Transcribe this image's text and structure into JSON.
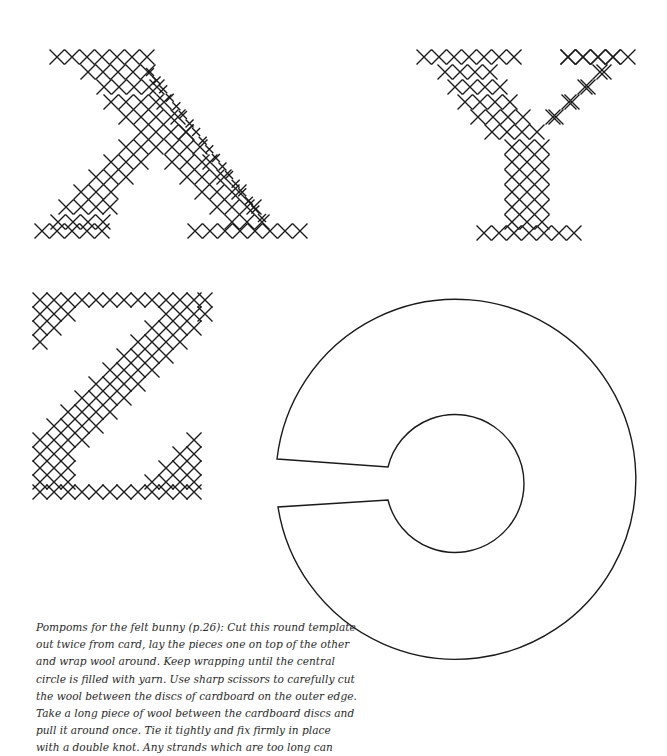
{
  "page": {
    "background": "#ffffff",
    "ink_color": "#1a1a1a"
  },
  "letters": [
    {
      "name": "X",
      "strokes": [
        {
          "from": [
            57,
            57
          ],
          "to": [
            57,
            57
          ],
          "count": 1
        },
        {
          "row": 57,
          "x_start": 57,
          "x_end": 150,
          "step": 15.5,
          "size": 7.5
        },
        {
          "row": 57,
          "x_start": 568,
          "x_end": 625,
          "step": 15.5,
          "size": 7.5,
          "comment": "unused"
        }
      ]
    }
  ],
  "caption": {
    "lines": [
      "Pompoms for the felt bunny (p.26): Cut this round template",
      "out twice from card, lay the pieces one on top of the other",
      "and wrap wool around. Keep wrapping until the central",
      "circle is filled with yarn. Use sharp scissors to carefully cut",
      "the wool between the discs of cardboard on the outer edge.",
      "Take a long piece of wool between the cardboard discs and",
      "pull it around once. Tie it tightly and fix firmly in place",
      "with a double knot. Any strands which are too long can"
    ]
  },
  "template": {
    "label": "pompom-template",
    "outer": {
      "cx": 455,
      "cy": 480,
      "r": 180
    },
    "inner": {
      "cx": 455,
      "cy": 484,
      "r": 69
    },
    "slot": {
      "outer_top": [
        277,
        459
      ],
      "inner_top": [
        388,
        467
      ],
      "inner_bottom": [
        388,
        500
      ],
      "outer_bottom": [
        278,
        507
      ]
    }
  },
  "cross_stitch": {
    "X": {
      "rows": [
        {
          "y": 57,
          "xs": [
            57,
            72,
            87,
            102,
            117,
            132,
            147
          ]
        },
        {
          "y": 57,
          "xs": [
            568,
            583,
            598,
            613
          ]
        },
        {
          "y": 72,
          "xs": [
            88,
            103,
            118,
            133,
            148
          ]
        },
        {
          "y": 72,
          "xs": [
            604
          ]
        },
        {
          "y": 87,
          "xs": [
            104,
            119,
            134,
            149,
            157
          ]
        },
        {
          "y": 87,
          "xs": [
            588
          ]
        },
        {
          "y": 102,
          "xs": [
            111,
            126,
            141,
            156,
            164
          ]
        },
        {
          "y": 102,
          "xs": [
            572
          ]
        },
        {
          "y": 117,
          "xs": [
            126,
            141,
            156,
            171,
            178
          ]
        },
        {
          "y": 117,
          "xs": [
            556
          ]
        },
        {
          "y": 132,
          "xs": [
            141,
            156,
            171,
            186
          ]
        },
        {
          "y": 132,
          "xs": [
            186
          ]
        },
        {
          "y": 147,
          "xs": [
            126,
            141,
            156,
            172,
            187,
            200
          ]
        },
        {
          "y": 162,
          "xs": [
            111,
            126,
            141,
            172,
            187,
            202,
            210
          ]
        },
        {
          "y": 177,
          "xs": [
            96,
            111,
            126,
            187,
            202,
            217,
            224
          ]
        },
        {
          "y": 192,
          "xs": [
            81,
            96,
            111,
            202,
            217,
            232,
            239
          ]
        },
        {
          "y": 207,
          "xs": [
            66,
            81,
            96,
            110,
            217,
            232,
            247,
            254
          ]
        },
        {
          "y": 222,
          "xs": [
            58,
            73,
            88,
            103,
            232,
            247,
            262
          ]
        },
        {
          "y": 231,
          "xs": [
            42,
            57,
            72,
            87,
            102,
            195,
            210,
            225,
            240,
            255,
            270,
            285,
            300
          ]
        }
      ],
      "small_diagonal": {
        "from": [
          150,
          72
        ],
        "to": [
          262,
          218
        ],
        "step": 7.5,
        "size": 4
      }
    },
    "Y": {
      "rows": [
        {
          "y": 57,
          "xs": [
            424,
            439,
            454,
            469,
            484,
            499,
            514
          ]
        },
        {
          "y": 57,
          "xs": [
            568,
            583,
            598,
            613,
            628
          ]
        },
        {
          "y": 72,
          "xs": [
            445,
            460,
            475,
            490,
            600
          ]
        },
        {
          "y": 87,
          "xs": [
            455,
            470,
            485,
            500,
            585
          ]
        },
        {
          "y": 102,
          "xs": [
            465,
            480,
            495,
            510,
            569
          ]
        },
        {
          "y": 117,
          "xs": [
            478,
            493,
            508,
            523,
            553
          ]
        },
        {
          "y": 132,
          "xs": [
            492,
            507,
            522,
            537
          ]
        },
        {
          "y": 147,
          "xs": [
            512,
            527,
            542
          ]
        },
        {
          "y": 162,
          "xs": [
            512,
            527,
            542
          ]
        },
        {
          "y": 177,
          "xs": [
            512,
            527,
            542
          ]
        },
        {
          "y": 192,
          "xs": [
            512,
            527,
            542
          ]
        },
        {
          "y": 207,
          "xs": [
            512,
            527,
            542
          ]
        },
        {
          "y": 222,
          "xs": [
            512,
            527,
            542
          ]
        },
        {
          "y": 233,
          "xs": [
            484,
            499,
            514,
            529,
            544,
            559,
            574
          ]
        }
      ]
    },
    "Z": {
      "rows": [
        {
          "y": 300,
          "xs": [
            40,
            54,
            68,
            82,
            96,
            110,
            124,
            138,
            152,
            166,
            180,
            194,
            205
          ]
        },
        {
          "y": 314,
          "xs": [
            40,
            54,
            68,
            166,
            180,
            194,
            205
          ]
        },
        {
          "y": 328,
          "xs": [
            40,
            54,
            152,
            166,
            180,
            194
          ]
        },
        {
          "y": 342,
          "xs": [
            40,
            138,
            152,
            166,
            180
          ]
        },
        {
          "y": 356,
          "xs": [
            124,
            138,
            152,
            166
          ]
        },
        {
          "y": 370,
          "xs": [
            110,
            124,
            138,
            152
          ]
        },
        {
          "y": 384,
          "xs": [
            96,
            110,
            124,
            138
          ]
        },
        {
          "y": 398,
          "xs": [
            82,
            96,
            110,
            124
          ]
        },
        {
          "y": 412,
          "xs": [
            68,
            82,
            96,
            110
          ]
        },
        {
          "y": 426,
          "xs": [
            54,
            68,
            82,
            96
          ]
        },
        {
          "y": 440,
          "xs": [
            40,
            54,
            68,
            82,
            194
          ]
        },
        {
          "y": 454,
          "xs": [
            40,
            54,
            68,
            180,
            194
          ]
        },
        {
          "y": 468,
          "xs": [
            40,
            54,
            68,
            166,
            180,
            194
          ]
        },
        {
          "y": 482,
          "xs": [
            40,
            54,
            68,
            152,
            166,
            180,
            194
          ]
        },
        {
          "y": 492,
          "xs": [
            40,
            54,
            68,
            82,
            96,
            110,
            124,
            138,
            152,
            166,
            180,
            194
          ]
        }
      ]
    }
  }
}
